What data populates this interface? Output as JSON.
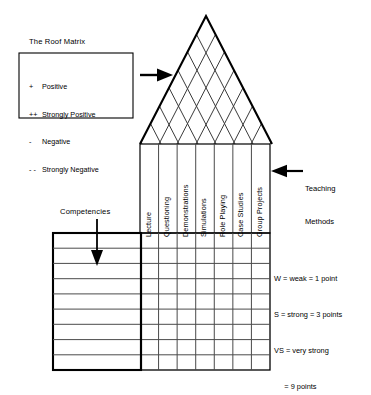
{
  "diagram": {
    "type": "house-of-quality-matrix",
    "roof_matrix_title": "The Roof Matrix",
    "legend": {
      "items": [
        {
          "symbol": "+",
          "label": "Positive"
        },
        {
          "symbol": "++",
          "label": "Strongly Positive"
        },
        {
          "symbol": "-",
          "label": "Negative"
        },
        {
          "symbol": "- -",
          "label": "Strongly Negative"
        }
      ]
    },
    "teaching_methods_label": "Teaching\nMethods",
    "teaching_methods_label_line1": "Teaching",
    "teaching_methods_label_line2": "Methods",
    "competencies_label": "Competencies",
    "columns": [
      "Lecture",
      "Questioning",
      "Demonstrations",
      "Simulations",
      "Role Playing",
      "Case Studies",
      "Group Projects"
    ],
    "row_count": 9,
    "scoring_legend": [
      "W = weak = 1 point",
      "S = strong = 3 points",
      "VS = very strong",
      "     = 9 points"
    ],
    "arrows": [
      {
        "name": "legend-to-roof-arrow",
        "direction": "right"
      },
      {
        "name": "teaching-methods-arrow",
        "direction": "left"
      },
      {
        "name": "competencies-arrow",
        "direction": "down"
      }
    ],
    "colors": {
      "ink": "#000000",
      "background": "#ffffff",
      "grid_line": "#4a4a4a"
    }
  }
}
